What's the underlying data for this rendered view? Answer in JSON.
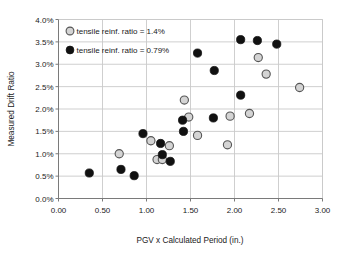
{
  "chart_data": {
    "type": "scatter",
    "title": "",
    "xlabel": "PGV x Calculated Period (in.)",
    "ylabel": "Measured Drift Ratio",
    "xlim": [
      0.0,
      3.0
    ],
    "ylim": [
      0.0,
      0.04
    ],
    "xticks": [
      0.0,
      0.5,
      1.0,
      1.5,
      2.0,
      2.5,
      3.0
    ],
    "xtick_labels": [
      "0.00",
      "0.50",
      "1.00",
      "1.50",
      "2.00",
      "2.50",
      "3.00"
    ],
    "yticks": [
      0.0,
      0.005,
      0.01,
      0.015,
      0.02,
      0.025,
      0.03,
      0.035,
      0.04
    ],
    "ytick_labels": [
      "0.0%",
      "0.5%",
      "1.0%",
      "1.5%",
      "2.0%",
      "2.5%",
      "3.0%",
      "3.5%",
      "4.0%"
    ],
    "grid": true,
    "legend_position": "top-left",
    "series": [
      {
        "name": "tensile reinf. ratio = 1.4%",
        "marker": "open-circle",
        "fill_color": "#d4d4d4",
        "edge_color": "#555555",
        "points": [
          {
            "x": 0.69,
            "y": 0.01
          },
          {
            "x": 1.05,
            "y": 0.0129
          },
          {
            "x": 1.12,
            "y": 0.0087
          },
          {
            "x": 1.18,
            "y": 0.0087
          },
          {
            "x": 1.26,
            "y": 0.0118
          },
          {
            "x": 1.43,
            "y": 0.022
          },
          {
            "x": 1.48,
            "y": 0.0182
          },
          {
            "x": 1.58,
            "y": 0.0141
          },
          {
            "x": 1.92,
            "y": 0.012
          },
          {
            "x": 1.95,
            "y": 0.0184
          },
          {
            "x": 2.17,
            "y": 0.019
          },
          {
            "x": 2.27,
            "y": 0.0315
          },
          {
            "x": 2.36,
            "y": 0.0278
          },
          {
            "x": 2.74,
            "y": 0.0248
          }
        ]
      },
      {
        "name": "tensile reinf. ratio = 0.79%",
        "marker": "filled-circle",
        "fill_color": "#111111",
        "edge_color": "#111111",
        "points": [
          {
            "x": 0.35,
            "y": 0.0057
          },
          {
            "x": 0.71,
            "y": 0.0065
          },
          {
            "x": 0.86,
            "y": 0.0051
          },
          {
            "x": 0.96,
            "y": 0.0145
          },
          {
            "x": 1.16,
            "y": 0.0123
          },
          {
            "x": 1.18,
            "y": 0.0098
          },
          {
            "x": 1.27,
            "y": 0.0083
          },
          {
            "x": 1.41,
            "y": 0.0175
          },
          {
            "x": 1.42,
            "y": 0.015
          },
          {
            "x": 1.58,
            "y": 0.0325
          },
          {
            "x": 1.77,
            "y": 0.0286
          },
          {
            "x": 1.76,
            "y": 0.018
          },
          {
            "x": 2.07,
            "y": 0.0355
          },
          {
            "x": 2.07,
            "y": 0.0231
          },
          {
            "x": 2.26,
            "y": 0.0353
          },
          {
            "x": 2.48,
            "y": 0.0345
          }
        ]
      }
    ]
  },
  "legend": {
    "entries": [
      {
        "label": "tensile reinf. ratio = 1.4%",
        "marker": "open-circle"
      },
      {
        "label": "tensile reinf. ratio = 0.79%",
        "marker": "filled-circle"
      }
    ]
  },
  "colors": {
    "background": "#ffffff",
    "grid": "#c9c9c9",
    "axis": "#7a7a7a",
    "text": "#1a1a1a",
    "open_marker_fill": "#d4d4d4",
    "open_marker_edge": "#555555",
    "filled_marker": "#111111"
  }
}
